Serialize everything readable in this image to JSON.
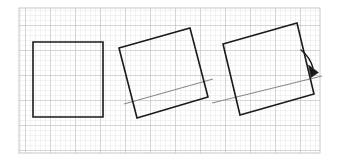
{
  "figure": {
    "title": "Rotation of a square about a point on an inclined line",
    "type": "geometry-diagram",
    "canvas": {
      "width": 339,
      "height": 161,
      "background": "#ffffff"
    },
    "border": {
      "name": "figure-frame",
      "x": 19,
      "y": 8,
      "width": 301,
      "height": 145,
      "color": "#c8c8c8",
      "stroke_width": 1
    },
    "grid": {
      "name": "graph-paper-grid",
      "minor_spacing": 5,
      "minor_color": "#d9d9d9",
      "major_spacing": 25,
      "major_color": "#b0b0b0",
      "x": 19,
      "y": 8,
      "width": 301,
      "height": 145,
      "visible": true
    },
    "shapes": [
      {
        "id": "square-1",
        "label": "Square 1 (unrotated)",
        "rotation_deg": 0,
        "stroke": "#1a1a1a",
        "stroke_width": 1.6,
        "fill": "none",
        "points": "33,42 103,42 103,117 33,117"
      },
      {
        "id": "square-2",
        "label": "Square 2 (rotated ~15 degrees counterclockwise)",
        "rotation_deg": -15,
        "stroke": "#1a1a1a",
        "stroke_width": 1.6,
        "fill": "none",
        "points": "119,48 190,28 208,97 137,118"
      },
      {
        "id": "square-3",
        "label": "Square 3 (rotated ~13 degrees counterclockwise)",
        "rotation_deg": -13,
        "stroke": "#1a1a1a",
        "stroke_width": 1.6,
        "fill": "none",
        "points": "223,44 297,23 314,94 240,115"
      }
    ],
    "reference_lines": [
      {
        "id": "ref-line-1",
        "label": "Inclined reference line through square 2",
        "stroke": "#8a8a8a",
        "stroke_width": 1.1,
        "x1": 124,
        "y1": 104,
        "x2": 213,
        "y2": 79
      },
      {
        "id": "ref-line-2",
        "label": "Inclined reference line through square 3",
        "stroke": "#8a8a8a",
        "stroke_width": 1.1,
        "x1": 212,
        "y1": 103,
        "x2": 322,
        "y2": 76
      }
    ],
    "arrow": {
      "id": "rotation-arrow",
      "label": "Curved arrow showing direction of rotation",
      "stroke": "#1a1a1a",
      "stroke_width": 1.3,
      "path": "M 301,50 Q 309,58 314,70",
      "head_points": "310,65 319,73 312,76"
    }
  }
}
